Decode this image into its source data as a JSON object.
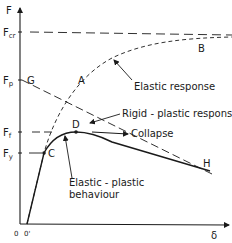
{
  "axes": {
    "y_label": "F",
    "x_label": "δ",
    "origin_label": "0",
    "origin_shift_label": "0'"
  },
  "y_levels": {
    "f_cr": {
      "main": "F",
      "sub": "cr"
    },
    "f_p": {
      "main": "F",
      "sub": "p"
    },
    "f_f": {
      "main": "F",
      "sub": "f"
    },
    "f_y": {
      "main": "F",
      "sub": "y"
    }
  },
  "points": {
    "a": "A",
    "b": "B",
    "c": "C",
    "d": "D",
    "g": "G",
    "h": "H"
  },
  "annotations": {
    "elastic_response": "Elastic response",
    "rigid_plastic_response": "Rigid - plastic response",
    "collapse": "Collapse",
    "elastic_plastic_line1": "Elastic - plastic",
    "elastic_plastic_line2": "behaviour"
  },
  "colors": {
    "ink": "#1a1a1a",
    "background": "#ffffff"
  }
}
